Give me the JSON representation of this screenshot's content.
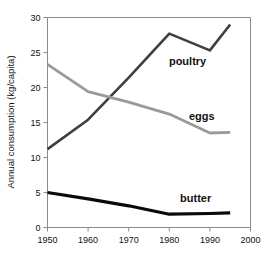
{
  "chart_data": {
    "type": "line",
    "title": "",
    "subtitle": "",
    "xlabel": "",
    "ylabel": "Annual consumption (kg/capita)",
    "xlim": [
      1950,
      2000
    ],
    "ylim": [
      0,
      30
    ],
    "xticks": [
      1950,
      1960,
      1970,
      1980,
      1990,
      2000
    ],
    "yticks": [
      0,
      5,
      10,
      15,
      20,
      25,
      30
    ],
    "xtick_labels": [
      "1950",
      "1960",
      "1970",
      "1980",
      "1990",
      "2000"
    ],
    "ytick_labels": [
      "0",
      "5",
      "10",
      "15",
      "20",
      "25",
      "30"
    ],
    "grid": false,
    "legend_position": "inline-right",
    "x": [
      1950,
      1960,
      1970,
      1980,
      1990,
      1995
    ],
    "series": [
      {
        "name": "poultry",
        "label": "poultry",
        "color": "#3f3f3f",
        "values": [
          11.2,
          15.4,
          21.4,
          27.7,
          25.3,
          29.0
        ]
      },
      {
        "name": "eggs",
        "label": "eggs",
        "color": "#9a9a9a",
        "values": [
          23.3,
          19.4,
          17.9,
          16.2,
          13.5,
          13.6
        ]
      },
      {
        "name": "butter",
        "label": "butter",
        "color": "#0a0a0a",
        "values": [
          5.0,
          4.1,
          3.1,
          1.9,
          2.0,
          2.1
        ]
      }
    ],
    "annotations": [
      {
        "text": "poultry",
        "x": 1984.5,
        "y": 23.2
      },
      {
        "text": "eggs",
        "x": 1988.0,
        "y": 15.3
      },
      {
        "text": "butter",
        "x": 1986.5,
        "y": 3.6
      }
    ],
    "frame_color": "#8a8a8a",
    "background": "#ffffff"
  }
}
